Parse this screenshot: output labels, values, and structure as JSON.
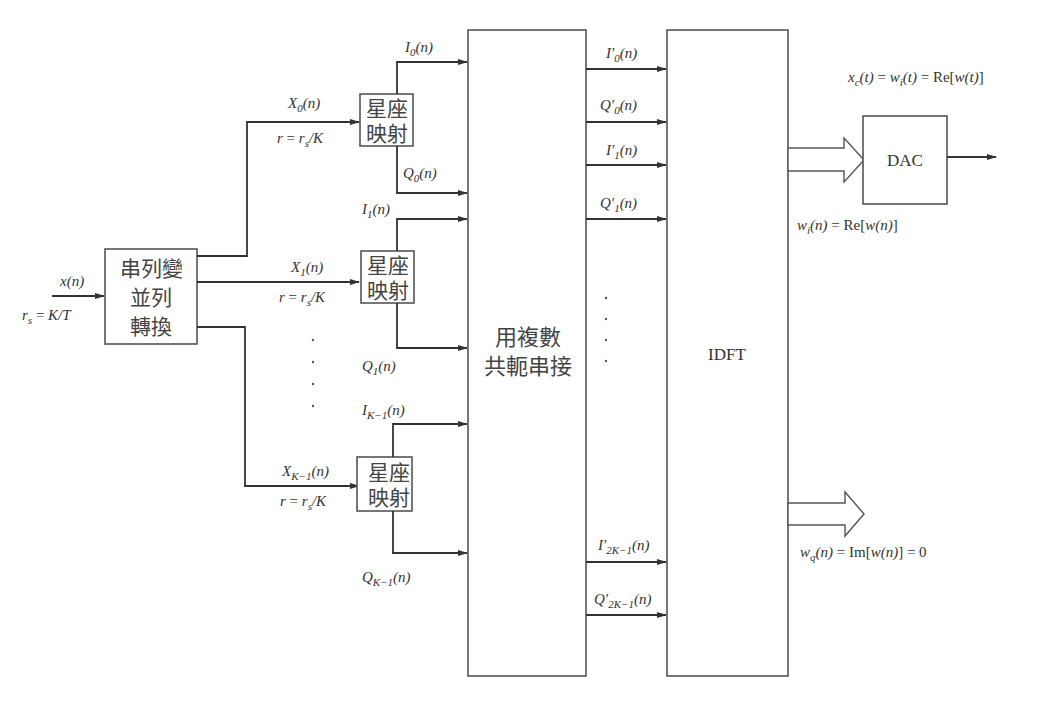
{
  "diagram": {
    "input": {
      "signal": "x(n)",
      "rate": "r_s = K/T"
    },
    "serial_to_parallel": {
      "lines": [
        "串列變",
        "並列",
        "轉換"
      ]
    },
    "branches": [
      {
        "input_label": "X_0(n)",
        "rate_label": "r = r_s/K",
        "mapper_lines": [
          "星座",
          "映射"
        ],
        "i_out": "I_0(n)",
        "q_out": "Q_0(n)"
      },
      {
        "input_label": "X_1(n)",
        "rate_label": "r = r_s/K",
        "mapper_lines": [
          "星座",
          "映射"
        ],
        "i_out": "I_1(n)",
        "q_out": "Q_1(n)"
      },
      {
        "input_label": "X_{K-1}(n)",
        "rate_label": "r = r_s/K",
        "mapper_lines": [
          "星座",
          "映射"
        ],
        "i_out": "I_{K-1}(n)",
        "q_out": "Q_{K-1}(n)"
      }
    ],
    "conjugate_block": {
      "lines": [
        "用複數",
        "共軛串接"
      ]
    },
    "conjugate_outputs": [
      "I'_0(n)",
      "Q'_0(n)",
      "I'_1(n)",
      "Q'_1(n)",
      "I'_{2K-1}(n)",
      "Q'_{2K-1}(n)"
    ],
    "idft_block": {
      "label": "IDFT"
    },
    "dac_block": {
      "label": "DAC"
    },
    "real_output": {
      "label": "w_i(n) = Re[w(n)]"
    },
    "imag_output": {
      "label": "w_q(n) = Im[w(n)] = 0"
    },
    "dac_output": {
      "label": "x_c(t) = w_i(t) = Re[w(t)]"
    },
    "ellipsis": "·"
  }
}
